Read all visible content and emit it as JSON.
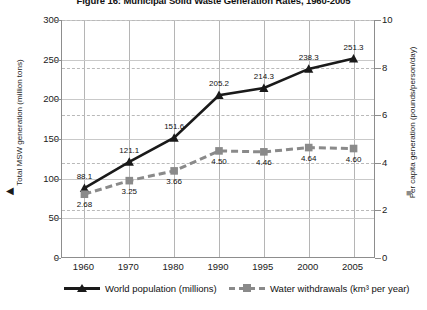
{
  "chart_data": {
    "type": "line",
    "title": "Figure 16: Municipal Solid Waste Generation Rates, 1960-2005",
    "xlabel": "",
    "categories": [
      "1960",
      "1970",
      "1980",
      "1990",
      "1995",
      "2000",
      "2005"
    ],
    "grid": true,
    "legend_position": "bottom",
    "axes": {
      "left": {
        "label": "Total MSW generation (million tons)",
        "ticks": [
          "0",
          "50",
          "100",
          "150",
          "200",
          "250",
          "300"
        ],
        "lim": [
          0,
          300
        ],
        "marker": "◀"
      },
      "right": {
        "label": "Per capita generation (pounds/person/day)",
        "ticks": [
          "0",
          "2",
          "4",
          "6",
          "8",
          "10"
        ],
        "lim": [
          0,
          10
        ],
        "marker": "■"
      }
    },
    "series": [
      {
        "name": "World population (millions)",
        "axis": "left",
        "marker": "triangle",
        "line": "solid",
        "color": "#1a1a1a",
        "values": [
          88.1,
          121.1,
          151.6,
          205.2,
          214.3,
          238.3,
          251.3
        ],
        "labels": [
          "88.1",
          "121.1",
          "151.6",
          "205.2",
          "214.3",
          "238.3",
          "251.3"
        ]
      },
      {
        "name": "Water withdrawals (km³ per year)",
        "axis": "right",
        "marker": "square",
        "line": "dashed",
        "color": "#8a8a8a",
        "values": [
          2.68,
          3.25,
          3.66,
          4.5,
          4.46,
          4.64,
          4.6
        ],
        "labels": [
          "2.68",
          "3.25",
          "3.66",
          "4.50",
          "4.46",
          "4.64",
          "4.60"
        ]
      }
    ]
  }
}
